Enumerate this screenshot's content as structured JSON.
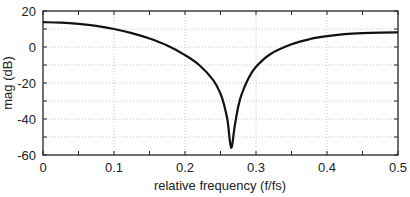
{
  "chart_data": {
    "type": "line",
    "title": "",
    "xlabel": "relative frequency (f/fs)",
    "ylabel": "mag (dB)",
    "xlim": [
      0,
      0.5
    ],
    "ylim": [
      -60,
      20
    ],
    "xticks": [
      0,
      0.1,
      0.2,
      0.3,
      0.4,
      0.5
    ],
    "xtick_labels": [
      "0",
      "0.1",
      "0.2",
      "0.3",
      "0.4",
      "0.5"
    ],
    "yticks": [
      20,
      0,
      -20,
      -40,
      -60
    ],
    "ytick_labels": [
      "20",
      "0",
      "-20",
      "-40",
      "-60"
    ],
    "grid": true,
    "legend": null,
    "series": [
      {
        "name": "magnitude response",
        "color": "#111111",
        "x": [
          0,
          0.025,
          0.05,
          0.075,
          0.1,
          0.125,
          0.15,
          0.175,
          0.2,
          0.22,
          0.24,
          0.25,
          0.255,
          0.26,
          0.265,
          0.27,
          0.275,
          0.28,
          0.29,
          0.3,
          0.32,
          0.35,
          0.375,
          0.4,
          0.425,
          0.45,
          0.475,
          0.5
        ],
        "y": [
          13.8,
          13.5,
          12.8,
          11.7,
          10.0,
          7.7,
          4.7,
          0.8,
          -4.5,
          -10.0,
          -18.5,
          -26.0,
          -32.0,
          -41.0,
          -56.0,
          -44.0,
          -33.0,
          -26.0,
          -17.0,
          -11.0,
          -4.0,
          1.5,
          4.3,
          6.0,
          7.1,
          7.7,
          8.0,
          8.1
        ]
      }
    ]
  }
}
